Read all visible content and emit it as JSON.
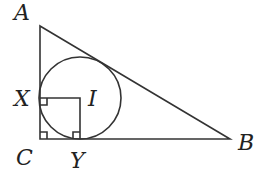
{
  "diagram": {
    "type": "geometry",
    "points": {
      "A": {
        "label": "A",
        "x": 40,
        "y": 26
      },
      "B": {
        "label": "B",
        "x": 230,
        "y": 139
      },
      "C": {
        "label": "C",
        "x": 40,
        "y": 139
      },
      "X": {
        "label": "X",
        "x": 40,
        "y": 98
      },
      "Y": {
        "label": "Y",
        "x": 80,
        "y": 139
      },
      "I": {
        "label": "I",
        "x": 80,
        "y": 98
      }
    },
    "incircle": {
      "cx": 80,
      "cy": 98,
      "r": 41
    },
    "right_angle_marks": [
      "C",
      "X",
      "Y"
    ],
    "stroke_color": "#333333"
  }
}
